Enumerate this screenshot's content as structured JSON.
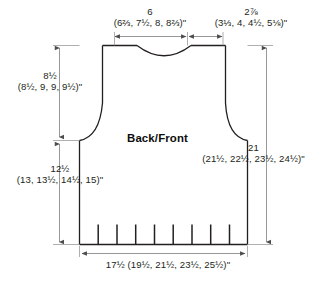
{
  "diagram": {
    "piece_label": "Back/Front",
    "measurements": {
      "neck_width": {
        "primary": "6",
        "sizes": "(6⅔, 7½, 8, 8⅔)\"",
        "position": "top-center"
      },
      "shoulder_width": {
        "primary": "2⅞",
        "sizes": "(3⅓, 4, 4½, 5⅛)\"",
        "position": "top-right"
      },
      "armhole_depth": {
        "primary": "8½",
        "sizes": "(8½, 9, 9, 9½)\"",
        "position": "left-upper"
      },
      "body_length_to_underarm": {
        "primary": "12½",
        "sizes": "(13, 13½, 14½, 15)\"",
        "position": "left-lower"
      },
      "total_length": {
        "primary": "21",
        "sizes": "(21½, 22½, 23½, 24½)\"",
        "position": "right"
      },
      "bottom_width": {
        "primary": "17½ (19½, 21½, 23½, 25½)\"",
        "sizes": "",
        "position": "bottom-center"
      }
    },
    "colors": {
      "outline": "#231f20",
      "dimension_line": "#8c8c8c",
      "text": "#231f20",
      "background": "#ffffff"
    },
    "ribbing_tick_count": 8
  }
}
